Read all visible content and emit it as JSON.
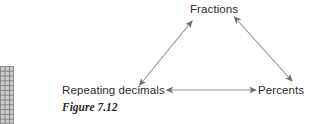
{
  "figure": {
    "caption": "Figure 7.12",
    "background_color": "#ffffff",
    "text_color": "#2b2b2b",
    "arrow_color": "#8a8a8a",
    "arrowhead_color": "#6e6e6e",
    "grid_line_color": "#8f8f8f",
    "grid_fill_color": "#c9c9c9"
  },
  "diagram": {
    "type": "triangle-relationship",
    "nodes": [
      {
        "id": "fractions",
        "label": "Fractions",
        "x": 215,
        "y": 10
      },
      {
        "id": "repeating_decimals",
        "label": "Repeating decimals",
        "x": 118,
        "y": 90
      },
      {
        "id": "percents",
        "label": "Percents",
        "x": 282,
        "y": 90
      }
    ],
    "edges": [
      {
        "id": "edge-repeating-fractions",
        "from": "repeating_decimals",
        "to": "fractions",
        "direction": "both",
        "x1": 143,
        "y1": 81,
        "x2": 192,
        "y2": 21
      },
      {
        "id": "edge-fractions-percents",
        "from": "fractions",
        "to": "percents",
        "direction": "both",
        "x1": 238,
        "y1": 21,
        "x2": 292,
        "y2": 81
      },
      {
        "id": "edge-repeating-percents",
        "from": "repeating_decimals",
        "to": "percents",
        "direction": "both",
        "x1": 172,
        "y1": 90,
        "x2": 256,
        "y2": 90
      }
    ]
  },
  "grid_fragment": {
    "name": "partial-grid-artifact",
    "columns": 3,
    "rows": 12,
    "cell_width": 4.6,
    "cell_height": 4.8
  }
}
